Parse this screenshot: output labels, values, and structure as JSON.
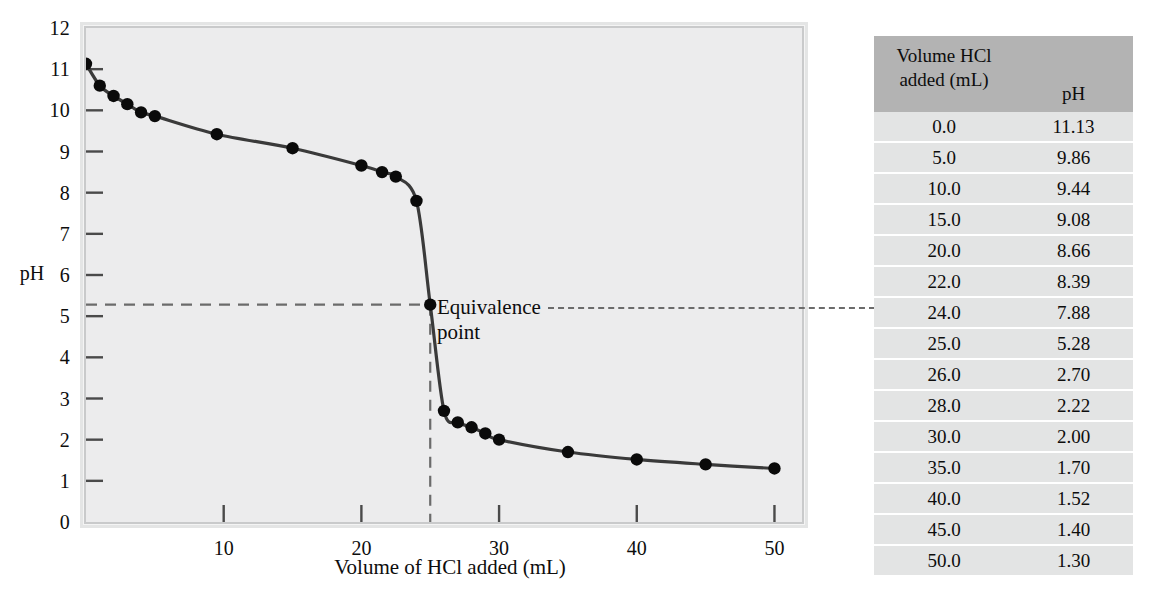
{
  "chart_data": {
    "type": "line",
    "title": "",
    "xlabel": "Volume of HCl added (mL)",
    "ylabel": "pH",
    "xlim": [
      0,
      52
    ],
    "ylim": [
      0,
      12
    ],
    "grid": false,
    "legend": "none",
    "x_ticks": [
      "10",
      "20",
      "30",
      "40",
      "50"
    ],
    "x_tick_values": [
      10,
      20,
      30,
      40,
      50
    ],
    "y_ticks": [
      "0",
      "1",
      "2",
      "3",
      "4",
      "5",
      "6",
      "7",
      "8",
      "9",
      "10",
      "11",
      "12"
    ],
    "y_tick_values": [
      0,
      1,
      2,
      3,
      4,
      5,
      6,
      7,
      8,
      9,
      10,
      11,
      12
    ],
    "series": [
      {
        "name": "Titration of strong base with HCl",
        "x": [
          0.0,
          1.0,
          2.0,
          3.0,
          4.0,
          5.0,
          9.5,
          15.0,
          20.0,
          21.5,
          22.5,
          24.0,
          25.0,
          26.0,
          27.0,
          28.0,
          29.0,
          30.0,
          35.0,
          40.0,
          45.0,
          50.0
        ],
        "y": [
          11.13,
          10.6,
          10.35,
          10.15,
          9.95,
          9.86,
          9.42,
          9.08,
          8.66,
          8.5,
          8.39,
          7.8,
          5.28,
          2.7,
          2.42,
          2.3,
          2.15,
          2.0,
          1.7,
          1.52,
          1.4,
          1.3
        ]
      }
    ],
    "annotations": [
      {
        "name": "equivalence-point",
        "label": "Equivalence\npoint",
        "x": 25.0,
        "y": 5.28,
        "guides": [
          "horizontal-to-y-axis",
          "vertical-to-x-axis"
        ],
        "leader": "dashed-line-to-table-row-25.0"
      }
    ],
    "table": {
      "columns": [
        "Volume HCl added (mL)",
        "pH"
      ],
      "rows": [
        [
          "0.0",
          "11.13"
        ],
        [
          "5.0",
          "9.86"
        ],
        [
          "10.0",
          "9.44"
        ],
        [
          "15.0",
          "9.08"
        ],
        [
          "20.0",
          "8.66"
        ],
        [
          "22.0",
          "8.39"
        ],
        [
          "24.0",
          "7.88"
        ],
        [
          "25.0",
          "5.28"
        ],
        [
          "26.0",
          "2.70"
        ],
        [
          "28.0",
          "2.22"
        ],
        [
          "30.0",
          "2.00"
        ],
        [
          "35.0",
          "1.70"
        ],
        [
          "40.0",
          "1.52"
        ],
        [
          "45.0",
          "1.40"
        ],
        [
          "50.0",
          "1.30"
        ]
      ]
    },
    "colors": {
      "curve": "#3a3a3a",
      "marker": "#0a0a0a",
      "plot_background": "#ececed",
      "frame": "#c9cacb",
      "table_header": "#b3b3b3",
      "table_row": "#e3e4e4",
      "guide_line": "#6b6b6b"
    }
  },
  "table_header": {
    "volume_line1": "Volume HCl",
    "volume_line2": "added (mL)",
    "ph": "pH"
  },
  "annotation": {
    "equivalence_line1": "Equivalence",
    "equivalence_line2": "point"
  }
}
